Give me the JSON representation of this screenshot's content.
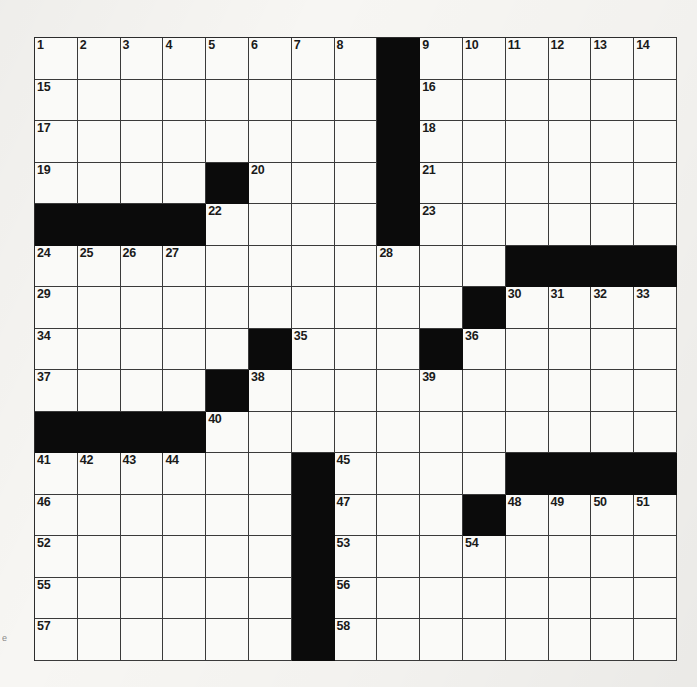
{
  "puzzle": {
    "type": "crossword-grid",
    "rows": 15,
    "columns": 15,
    "colors": {
      "block": "#0b0b0b",
      "cell": "#fafaf8",
      "grid_line": "#3a3a3a",
      "paper": "#f7f6f3",
      "number_text": "#1a1a1a"
    },
    "edge_mark": "e",
    "grid": [
      [
        {
          "block": false,
          "number": "1"
        },
        {
          "block": false,
          "number": "2"
        },
        {
          "block": false,
          "number": "3"
        },
        {
          "block": false,
          "number": "4"
        },
        {
          "block": false,
          "number": "5"
        },
        {
          "block": false,
          "number": "6"
        },
        {
          "block": false,
          "number": "7"
        },
        {
          "block": false,
          "number": "8"
        },
        {
          "block": true,
          "number": ""
        },
        {
          "block": false,
          "number": "9"
        },
        {
          "block": false,
          "number": "10"
        },
        {
          "block": false,
          "number": "11"
        },
        {
          "block": false,
          "number": "12"
        },
        {
          "block": false,
          "number": "13"
        },
        {
          "block": false,
          "number": "14"
        }
      ],
      [
        {
          "block": false,
          "number": "15"
        },
        {
          "block": false,
          "number": ""
        },
        {
          "block": false,
          "number": ""
        },
        {
          "block": false,
          "number": ""
        },
        {
          "block": false,
          "number": ""
        },
        {
          "block": false,
          "number": ""
        },
        {
          "block": false,
          "number": ""
        },
        {
          "block": false,
          "number": ""
        },
        {
          "block": true,
          "number": ""
        },
        {
          "block": false,
          "number": "16"
        },
        {
          "block": false,
          "number": ""
        },
        {
          "block": false,
          "number": ""
        },
        {
          "block": false,
          "number": ""
        },
        {
          "block": false,
          "number": ""
        },
        {
          "block": false,
          "number": ""
        }
      ],
      [
        {
          "block": false,
          "number": "17"
        },
        {
          "block": false,
          "number": ""
        },
        {
          "block": false,
          "number": ""
        },
        {
          "block": false,
          "number": ""
        },
        {
          "block": false,
          "number": ""
        },
        {
          "block": false,
          "number": ""
        },
        {
          "block": false,
          "number": ""
        },
        {
          "block": false,
          "number": ""
        },
        {
          "block": true,
          "number": ""
        },
        {
          "block": false,
          "number": "18"
        },
        {
          "block": false,
          "number": ""
        },
        {
          "block": false,
          "number": ""
        },
        {
          "block": false,
          "number": ""
        },
        {
          "block": false,
          "number": ""
        },
        {
          "block": false,
          "number": ""
        }
      ],
      [
        {
          "block": false,
          "number": "19"
        },
        {
          "block": false,
          "number": ""
        },
        {
          "block": false,
          "number": ""
        },
        {
          "block": false,
          "number": ""
        },
        {
          "block": true,
          "number": ""
        },
        {
          "block": false,
          "number": "20"
        },
        {
          "block": false,
          "number": ""
        },
        {
          "block": false,
          "number": ""
        },
        {
          "block": true,
          "number": ""
        },
        {
          "block": false,
          "number": "21"
        },
        {
          "block": false,
          "number": ""
        },
        {
          "block": false,
          "number": ""
        },
        {
          "block": false,
          "number": ""
        },
        {
          "block": false,
          "number": ""
        },
        {
          "block": false,
          "number": ""
        }
      ],
      [
        {
          "block": true,
          "number": ""
        },
        {
          "block": true,
          "number": ""
        },
        {
          "block": true,
          "number": ""
        },
        {
          "block": true,
          "number": ""
        },
        {
          "block": false,
          "number": "22"
        },
        {
          "block": false,
          "number": ""
        },
        {
          "block": false,
          "number": ""
        },
        {
          "block": false,
          "number": ""
        },
        {
          "block": true,
          "number": ""
        },
        {
          "block": false,
          "number": "23"
        },
        {
          "block": false,
          "number": ""
        },
        {
          "block": false,
          "number": ""
        },
        {
          "block": false,
          "number": ""
        },
        {
          "block": false,
          "number": ""
        },
        {
          "block": false,
          "number": ""
        }
      ],
      [
        {
          "block": false,
          "number": "24"
        },
        {
          "block": false,
          "number": "25"
        },
        {
          "block": false,
          "number": "26"
        },
        {
          "block": false,
          "number": "27"
        },
        {
          "block": false,
          "number": ""
        },
        {
          "block": false,
          "number": ""
        },
        {
          "block": false,
          "number": ""
        },
        {
          "block": false,
          "number": ""
        },
        {
          "block": false,
          "number": "28"
        },
        {
          "block": false,
          "number": ""
        },
        {
          "block": false,
          "number": ""
        },
        {
          "block": true,
          "number": ""
        },
        {
          "block": true,
          "number": ""
        },
        {
          "block": true,
          "number": ""
        },
        {
          "block": true,
          "number": ""
        }
      ],
      [
        {
          "block": false,
          "number": "29"
        },
        {
          "block": false,
          "number": ""
        },
        {
          "block": false,
          "number": ""
        },
        {
          "block": false,
          "number": ""
        },
        {
          "block": false,
          "number": ""
        },
        {
          "block": false,
          "number": ""
        },
        {
          "block": false,
          "number": ""
        },
        {
          "block": false,
          "number": ""
        },
        {
          "block": false,
          "number": ""
        },
        {
          "block": false,
          "number": ""
        },
        {
          "block": true,
          "number": ""
        },
        {
          "block": false,
          "number": "30"
        },
        {
          "block": false,
          "number": "31"
        },
        {
          "block": false,
          "number": "32"
        },
        {
          "block": false,
          "number": "33"
        }
      ],
      [
        {
          "block": false,
          "number": "34"
        },
        {
          "block": false,
          "number": ""
        },
        {
          "block": false,
          "number": ""
        },
        {
          "block": false,
          "number": ""
        },
        {
          "block": false,
          "number": ""
        },
        {
          "block": true,
          "number": ""
        },
        {
          "block": false,
          "number": "35"
        },
        {
          "block": false,
          "number": ""
        },
        {
          "block": false,
          "number": ""
        },
        {
          "block": true,
          "number": ""
        },
        {
          "block": false,
          "number": "36"
        },
        {
          "block": false,
          "number": ""
        },
        {
          "block": false,
          "number": ""
        },
        {
          "block": false,
          "number": ""
        },
        {
          "block": false,
          "number": ""
        }
      ],
      [
        {
          "block": false,
          "number": "37"
        },
        {
          "block": false,
          "number": ""
        },
        {
          "block": false,
          "number": ""
        },
        {
          "block": false,
          "number": ""
        },
        {
          "block": true,
          "number": ""
        },
        {
          "block": false,
          "number": "38"
        },
        {
          "block": false,
          "number": ""
        },
        {
          "block": false,
          "number": ""
        },
        {
          "block": false,
          "number": ""
        },
        {
          "block": false,
          "number": "39"
        },
        {
          "block": false,
          "number": ""
        },
        {
          "block": false,
          "number": ""
        },
        {
          "block": false,
          "number": ""
        },
        {
          "block": false,
          "number": ""
        },
        {
          "block": false,
          "number": ""
        }
      ],
      [
        {
          "block": true,
          "number": ""
        },
        {
          "block": true,
          "number": ""
        },
        {
          "block": true,
          "number": ""
        },
        {
          "block": true,
          "number": ""
        },
        {
          "block": false,
          "number": "40"
        },
        {
          "block": false,
          "number": ""
        },
        {
          "block": false,
          "number": ""
        },
        {
          "block": false,
          "number": ""
        },
        {
          "block": false,
          "number": ""
        },
        {
          "block": false,
          "number": ""
        },
        {
          "block": false,
          "number": ""
        },
        {
          "block": false,
          "number": ""
        },
        {
          "block": false,
          "number": ""
        },
        {
          "block": false,
          "number": ""
        },
        {
          "block": false,
          "number": ""
        }
      ],
      [
        {
          "block": false,
          "number": "41"
        },
        {
          "block": false,
          "number": "42"
        },
        {
          "block": false,
          "number": "43"
        },
        {
          "block": false,
          "number": "44"
        },
        {
          "block": false,
          "number": ""
        },
        {
          "block": false,
          "number": ""
        },
        {
          "block": true,
          "number": ""
        },
        {
          "block": false,
          "number": "45"
        },
        {
          "block": false,
          "number": ""
        },
        {
          "block": false,
          "number": ""
        },
        {
          "block": false,
          "number": ""
        },
        {
          "block": true,
          "number": ""
        },
        {
          "block": true,
          "number": ""
        },
        {
          "block": true,
          "number": ""
        },
        {
          "block": true,
          "number": ""
        }
      ],
      [
        {
          "block": false,
          "number": "46"
        },
        {
          "block": false,
          "number": ""
        },
        {
          "block": false,
          "number": ""
        },
        {
          "block": false,
          "number": ""
        },
        {
          "block": false,
          "number": ""
        },
        {
          "block": false,
          "number": ""
        },
        {
          "block": true,
          "number": ""
        },
        {
          "block": false,
          "number": "47"
        },
        {
          "block": false,
          "number": ""
        },
        {
          "block": false,
          "number": ""
        },
        {
          "block": true,
          "number": ""
        },
        {
          "block": false,
          "number": "48"
        },
        {
          "block": false,
          "number": "49"
        },
        {
          "block": false,
          "number": "50"
        },
        {
          "block": false,
          "number": "51"
        }
      ],
      [
        {
          "block": false,
          "number": "52"
        },
        {
          "block": false,
          "number": ""
        },
        {
          "block": false,
          "number": ""
        },
        {
          "block": false,
          "number": ""
        },
        {
          "block": false,
          "number": ""
        },
        {
          "block": false,
          "number": ""
        },
        {
          "block": true,
          "number": ""
        },
        {
          "block": false,
          "number": "53"
        },
        {
          "block": false,
          "number": ""
        },
        {
          "block": false,
          "number": ""
        },
        {
          "block": false,
          "number": "54"
        },
        {
          "block": false,
          "number": ""
        },
        {
          "block": false,
          "number": ""
        },
        {
          "block": false,
          "number": ""
        },
        {
          "block": false,
          "number": ""
        }
      ],
      [
        {
          "block": false,
          "number": "55"
        },
        {
          "block": false,
          "number": ""
        },
        {
          "block": false,
          "number": ""
        },
        {
          "block": false,
          "number": ""
        },
        {
          "block": false,
          "number": ""
        },
        {
          "block": false,
          "number": ""
        },
        {
          "block": true,
          "number": ""
        },
        {
          "block": false,
          "number": "56"
        },
        {
          "block": false,
          "number": ""
        },
        {
          "block": false,
          "number": ""
        },
        {
          "block": false,
          "number": ""
        },
        {
          "block": false,
          "number": ""
        },
        {
          "block": false,
          "number": ""
        },
        {
          "block": false,
          "number": ""
        },
        {
          "block": false,
          "number": ""
        }
      ],
      [
        {
          "block": false,
          "number": "57"
        },
        {
          "block": false,
          "number": ""
        },
        {
          "block": false,
          "number": ""
        },
        {
          "block": false,
          "number": ""
        },
        {
          "block": false,
          "number": ""
        },
        {
          "block": false,
          "number": ""
        },
        {
          "block": true,
          "number": ""
        },
        {
          "block": false,
          "number": "58"
        },
        {
          "block": false,
          "number": ""
        },
        {
          "block": false,
          "number": ""
        },
        {
          "block": false,
          "number": ""
        },
        {
          "block": false,
          "number": ""
        },
        {
          "block": false,
          "number": ""
        },
        {
          "block": false,
          "number": ""
        },
        {
          "block": false,
          "number": ""
        }
      ]
    ]
  }
}
